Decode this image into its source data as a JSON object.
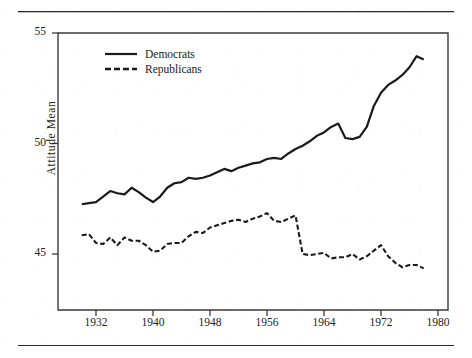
{
  "figure": {
    "rules": {
      "top": true,
      "bottom": true
    },
    "background_color": "#ffffff",
    "ink_color": "#1a1a1a"
  },
  "chart_data": {
    "type": "line",
    "title": "",
    "xlabel": "",
    "ylabel": "Attitude Mean",
    "xlim": [
      1930,
      1980
    ],
    "ylim": [
      42.6,
      55
    ],
    "grid": false,
    "legend_position": "top-left",
    "xticks": [
      1932,
      1940,
      1948,
      1956,
      1964,
      1972,
      1980
    ],
    "yticks": [
      45,
      50,
      55
    ],
    "x": [
      1930,
      1931,
      1932,
      1933,
      1934,
      1935,
      1936,
      1937,
      1938,
      1939,
      1940,
      1941,
      1942,
      1943,
      1944,
      1945,
      1946,
      1947,
      1948,
      1949,
      1950,
      1951,
      1952,
      1953,
      1954,
      1955,
      1956,
      1957,
      1958,
      1959,
      1960,
      1961,
      1962,
      1963,
      1964,
      1965,
      1966,
      1967,
      1968,
      1969,
      1970,
      1971,
      1972,
      1973,
      1974,
      1975,
      1976,
      1977,
      1978
    ],
    "series": [
      {
        "name": "Democrats",
        "style": "solid",
        "color": "#1a1a1a",
        "values": [
          47.25,
          47.3,
          47.35,
          47.6,
          47.85,
          47.75,
          47.7,
          48.0,
          47.8,
          47.55,
          47.35,
          47.6,
          48.0,
          48.2,
          48.25,
          48.45,
          48.4,
          48.45,
          48.55,
          48.7,
          48.85,
          48.75,
          48.9,
          49.0,
          49.1,
          49.15,
          49.3,
          49.35,
          49.3,
          49.55,
          49.75,
          49.9,
          50.1,
          50.35,
          50.5,
          50.75,
          50.9,
          50.25,
          50.2,
          50.3,
          50.75,
          51.7,
          52.3,
          52.65,
          52.85,
          53.1,
          53.45,
          53.95,
          53.8
        ]
      },
      {
        "name": "Republicans",
        "style": "dashed",
        "color": "#1a1a1a",
        "values": [
          45.85,
          45.9,
          45.5,
          45.45,
          45.75,
          45.4,
          45.75,
          45.6,
          45.6,
          45.4,
          45.1,
          45.15,
          45.45,
          45.5,
          45.5,
          45.8,
          46.0,
          45.95,
          46.2,
          46.3,
          46.4,
          46.5,
          46.55,
          46.45,
          46.6,
          46.7,
          46.85,
          46.5,
          46.45,
          46.6,
          46.75,
          45.0,
          44.95,
          45.0,
          45.05,
          44.8,
          44.85,
          44.85,
          45.0,
          44.75,
          44.9,
          45.15,
          45.4,
          44.9,
          44.6,
          44.4,
          44.5,
          44.5,
          44.35
        ]
      }
    ]
  },
  "legend": {
    "items": [
      {
        "label": "Democrats",
        "style": "solid"
      },
      {
        "label": "Republicans",
        "style": "dashed"
      }
    ]
  },
  "axes": {
    "y_axis_title": "Attitude Mean",
    "y_tick_labels": [
      "55",
      "50",
      "45"
    ],
    "x_tick_labels": [
      "1932",
      "1940",
      "1948",
      "1956",
      "1964",
      "1972",
      "1980"
    ]
  }
}
